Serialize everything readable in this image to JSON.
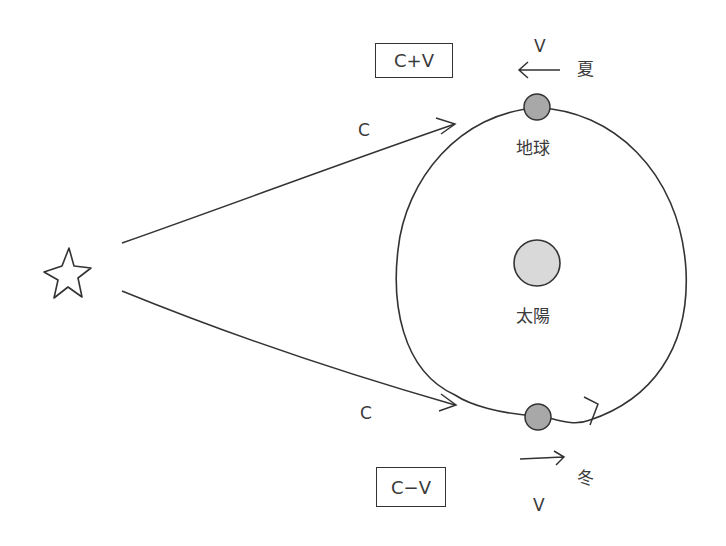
{
  "diagram": {
    "type": "astronomy-aberration-diagram",
    "labels": {
      "c_plus_v": "C+V",
      "c_minus_v": "C−V",
      "c_top": "C",
      "c_bottom": "C",
      "v_top": "V",
      "v_bottom": "V",
      "summer": "夏",
      "winter": "冬",
      "earth": "地球",
      "sun": "太陽"
    },
    "nodes": [
      {
        "id": "star",
        "shape": "star-outline"
      },
      {
        "id": "sun",
        "shape": "circle",
        "fill": "#d9d9d9"
      },
      {
        "id": "earth-summer",
        "shape": "circle",
        "fill": "#a8a8a8"
      },
      {
        "id": "earth-winter",
        "shape": "circle",
        "fill": "#a8a8a8"
      },
      {
        "id": "orbit",
        "shape": "ellipse"
      }
    ],
    "edges": [
      {
        "from": "star",
        "to": "earth-summer",
        "label": "C"
      },
      {
        "from": "star",
        "to": "earth-winter",
        "label": "C"
      }
    ],
    "colors": {
      "stroke": "#333333",
      "sun_fill": "#d9d9d9",
      "earth_fill": "#a8a8a8"
    }
  }
}
